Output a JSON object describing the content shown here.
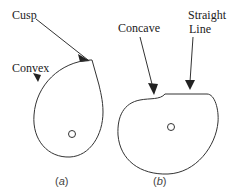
{
  "diagram": {
    "type": "cam-profiles",
    "figures": [
      {
        "id": "a",
        "caption_open": "(",
        "caption_letter": "a",
        "caption_close": ")",
        "labels": {
          "cusp": "Cusp",
          "convex": "Convex"
        }
      },
      {
        "id": "b",
        "caption_open": "(",
        "caption_letter": "b",
        "caption_close": ")",
        "labels": {
          "concave": "Concave",
          "straight_line_1": "Straight",
          "straight_line_2": "Line"
        }
      }
    ],
    "colors": {
      "stroke": "#333333",
      "text": "#222222",
      "background": "#ffffff"
    }
  }
}
